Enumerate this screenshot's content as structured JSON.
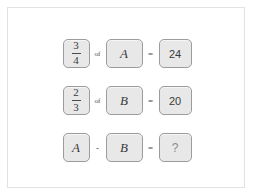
{
  "panel": {
    "background_color": "#ffffff",
    "border_color": "#e2e2e2"
  },
  "style": {
    "box_fill": "#e8e8e8",
    "box_border": "#9c9c9c",
    "text_color": "#3a3a3a",
    "placeholder_color": "#8a8a8a"
  },
  "puzzle": {
    "rows": [
      {
        "fraction": {
          "numerator": "3",
          "denominator": "4"
        },
        "operator_multiply": "of",
        "variable": "A",
        "operator_equals": "=",
        "result": "24"
      },
      {
        "fraction": {
          "numerator": "2",
          "denominator": "3"
        },
        "operator_multiply": "of",
        "variable": "B",
        "operator_equals": "=",
        "result": "20"
      },
      {
        "left_variable": "A",
        "operator_subtract": "-",
        "right_variable": "B",
        "operator_equals": "=",
        "result": "?"
      }
    ]
  }
}
